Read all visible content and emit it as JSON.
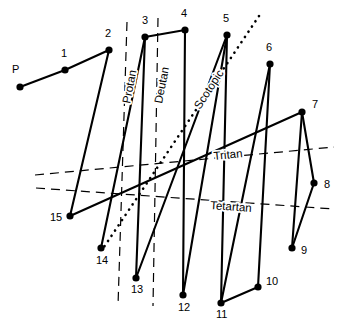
{
  "figure": {
    "width": 339,
    "height": 335,
    "background": "#ffffff",
    "ink": "#000000"
  },
  "nodes": [
    {
      "id": "P",
      "label": "P",
      "x": 20,
      "y": 87,
      "lx": 12,
      "ly": 73
    },
    {
      "id": "1",
      "label": "1",
      "x": 65,
      "y": 70,
      "lx": 61,
      "ly": 57
    },
    {
      "id": "2",
      "label": "2",
      "x": 109,
      "y": 50,
      "lx": 105,
      "ly": 37
    },
    {
      "id": "3",
      "label": "3",
      "x": 145,
      "y": 37,
      "lx": 142,
      "ly": 24
    },
    {
      "id": "4",
      "label": "4",
      "x": 185,
      "y": 30,
      "lx": 181,
      "ly": 17
    },
    {
      "id": "5",
      "label": "5",
      "x": 227,
      "y": 35,
      "lx": 223,
      "ly": 22
    },
    {
      "id": "6",
      "label": "6",
      "x": 270,
      "y": 64,
      "lx": 266,
      "ly": 51
    },
    {
      "id": "7",
      "label": "7",
      "x": 302,
      "y": 112,
      "lx": 312,
      "ly": 108
    },
    {
      "id": "8",
      "label": "8",
      "x": 314,
      "y": 183,
      "lx": 324,
      "ly": 188
    },
    {
      "id": "9",
      "label": "9",
      "x": 292,
      "y": 248,
      "lx": 301,
      "ly": 254
    },
    {
      "id": "10",
      "label": "10",
      "x": 258,
      "y": 287,
      "lx": 266,
      "ly": 285
    },
    {
      "id": "11",
      "label": "11",
      "x": 221,
      "y": 303,
      "lx": 216,
      "ly": 318
    },
    {
      "id": "12",
      "label": "12",
      "x": 183,
      "y": 295,
      "lx": 178,
      "ly": 311
    },
    {
      "id": "13",
      "label": "13",
      "x": 136,
      "y": 278,
      "lx": 131,
      "ly": 293
    },
    {
      "id": "14",
      "label": "14",
      "x": 101,
      "y": 248,
      "lx": 96,
      "ly": 264
    },
    {
      "id": "15",
      "label": "15",
      "x": 70,
      "y": 216,
      "lx": 50,
      "ly": 221
    }
  ],
  "segments": [
    {
      "name": "segment-P-1",
      "from": "P",
      "to": "1"
    },
    {
      "name": "segment-1-2",
      "from": "1",
      "to": "2"
    },
    {
      "name": "segment-2-15",
      "from": "2",
      "to": "15"
    },
    {
      "name": "segment-3-4",
      "from": "3",
      "to": "4"
    },
    {
      "name": "segment-3-13",
      "from": "3",
      "to": "13"
    },
    {
      "name": "segment-4-12",
      "from": "4",
      "to": "12"
    },
    {
      "name": "segment-5-12",
      "from": "5",
      "to": "12"
    },
    {
      "name": "segment-5-11",
      "from": "5",
      "to": "11"
    },
    {
      "name": "segment-6-11",
      "from": "6",
      "to": "11"
    },
    {
      "name": "segment-6-10",
      "from": "6",
      "to": "10"
    },
    {
      "name": "segment-10-11",
      "from": "10",
      "to": "11"
    },
    {
      "name": "segment-7-8",
      "from": "7",
      "to": "8"
    },
    {
      "name": "segment-7-9",
      "from": "7",
      "to": "9"
    },
    {
      "name": "segment-8-9",
      "from": "8",
      "to": "9"
    },
    {
      "name": "segment-14-3",
      "from": "14",
      "to": "3"
    },
    {
      "name": "segment-13-5",
      "from": "13",
      "to": "5"
    },
    {
      "name": "segment-15-7",
      "from": "15",
      "to": "7"
    }
  ],
  "confusion_lines": [
    {
      "name": "protan-line",
      "label": "Protan",
      "style": "dashed",
      "x1": 127,
      "y1": 22,
      "x2": 118,
      "y2": 306,
      "label_x": 130,
      "label_y": 104,
      "label_rot": -79
    },
    {
      "name": "deutan-line",
      "label": "Deutan",
      "style": "dashed",
      "x1": 158,
      "y1": 18,
      "x2": 153,
      "y2": 306,
      "label_x": 162,
      "label_y": 104,
      "label_rot": -79
    },
    {
      "name": "scotopic-line",
      "label": "Scotopic",
      "style": "dotted",
      "x1": 259,
      "y1": 16,
      "x2": 104,
      "y2": 247,
      "label_x": 200,
      "label_y": 110,
      "label_rot": -57
    },
    {
      "name": "tritan-line",
      "label": "Tritan",
      "style": "dashed",
      "x1": 35,
      "y1": 175,
      "x2": 334,
      "y2": 147,
      "label_x": 214,
      "label_y": 160,
      "label_rot": -6
    },
    {
      "name": "tetartan-line",
      "label": "Tetartan",
      "style": "dashed",
      "x1": 36,
      "y1": 188,
      "x2": 334,
      "y2": 209,
      "label_x": 210,
      "label_y": 209,
      "label_rot": 4
    }
  ]
}
